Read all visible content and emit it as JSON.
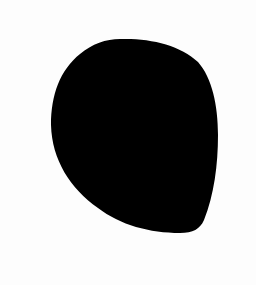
{
  "image": {
    "background_color": "#fdfdfd",
    "shape": {
      "kind": "blob",
      "fill_color": "#000000"
    }
  }
}
